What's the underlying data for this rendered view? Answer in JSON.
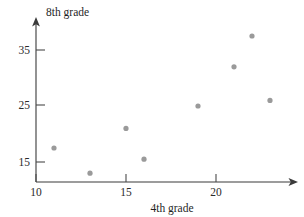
{
  "chart_data": {
    "type": "scatter",
    "title": "",
    "xlabel": "4th grade",
    "ylabel": "8th grade",
    "xlim": [
      10,
      23.8
    ],
    "ylim": [
      12,
      39
    ],
    "xticks": [
      10,
      15,
      20
    ],
    "xticklabels": [
      "10",
      "15",
      "20"
    ],
    "yticks": [
      15,
      25,
      35
    ],
    "yticklabels": [
      "15",
      "25",
      "35"
    ],
    "grid": false,
    "legend": null,
    "point_color": "#9a9a9a",
    "axis_color": "#3a3a3a",
    "series": [
      {
        "name": "scores",
        "points": [
          {
            "x": 11,
            "y": 17.5
          },
          {
            "x": 13,
            "y": 13
          },
          {
            "x": 15,
            "y": 21
          },
          {
            "x": 16,
            "y": 15.5
          },
          {
            "x": 19,
            "y": 25
          },
          {
            "x": 21,
            "y": 32
          },
          {
            "x": 22,
            "y": 37.5
          },
          {
            "x": 23,
            "y": 26
          }
        ]
      }
    ]
  },
  "labels": {
    "y_axis_title": "8th grade",
    "x_axis_title": "4th grade",
    "y_tick_35": "35",
    "y_tick_25": "25",
    "y_tick_15": "15",
    "x_tick_10": "10",
    "x_tick_15": "15",
    "x_tick_20": "20"
  }
}
